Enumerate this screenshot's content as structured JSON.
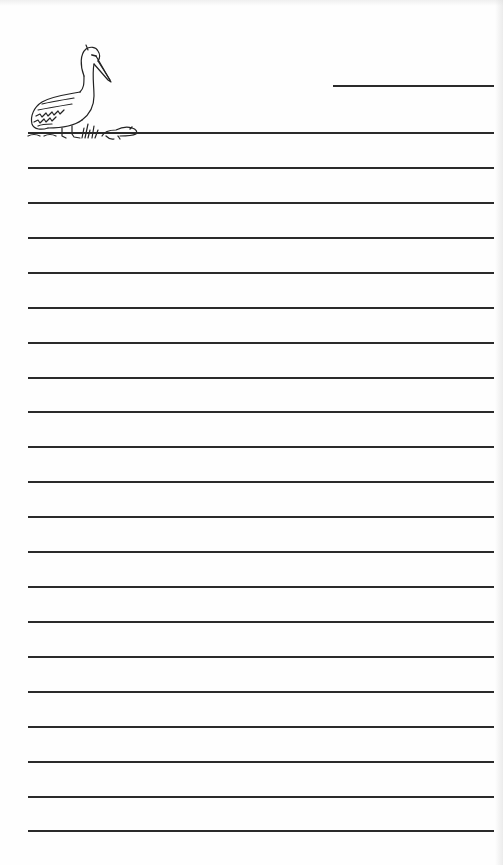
{
  "page": {
    "type": "lined writing paper",
    "background": "#ffffff",
    "line_color": "#2a2a2a"
  },
  "illustration": {
    "subject": "pelican standing beside a small prairie dog",
    "icon": "pelican-icon"
  },
  "name_line": {
    "x_start": 333,
    "x_end": 494,
    "y": 86
  },
  "ruled_lines": {
    "count": 21,
    "x_start": 28,
    "x_end": 494,
    "y_positions": [
      133,
      168,
      203,
      238,
      273,
      308,
      343,
      378,
      412,
      447,
      482,
      517,
      552,
      587,
      622,
      657,
      692,
      727,
      762,
      797,
      831
    ]
  }
}
